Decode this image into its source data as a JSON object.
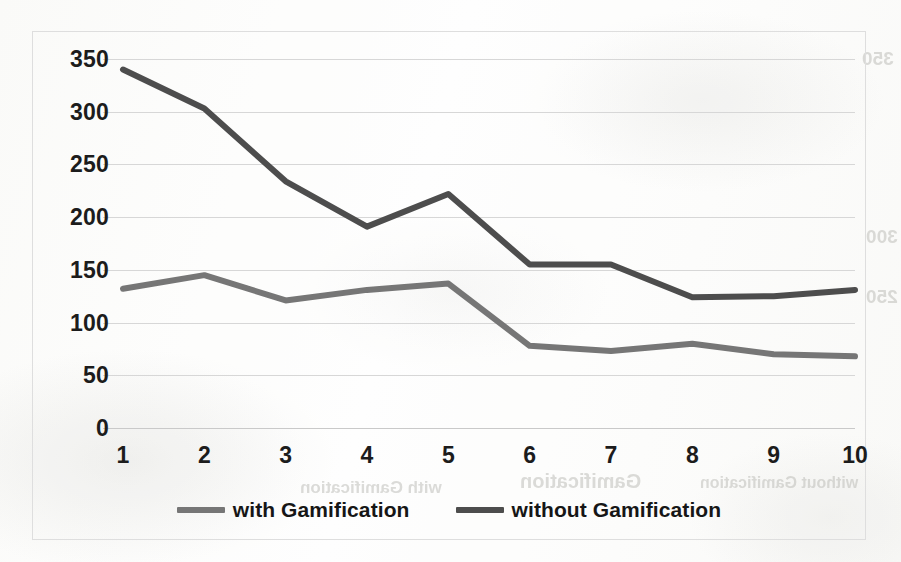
{
  "chart_data": {
    "type": "line",
    "title": "",
    "subtitle": "",
    "xlabel": "",
    "ylabel": "",
    "categories": [
      "1",
      "2",
      "3",
      "4",
      "5",
      "6",
      "7",
      "8",
      "9",
      "10"
    ],
    "x": [
      1,
      2,
      3,
      4,
      5,
      6,
      7,
      8,
      9,
      10
    ],
    "series": [
      {
        "name": "with Gamification",
        "color": "#767676",
        "values": [
          132,
          145,
          121,
          131,
          137,
          78,
          73,
          80,
          70,
          68
        ]
      },
      {
        "name": "without Gamification",
        "color": "#4d4d4d",
        "values": [
          340,
          303,
          234,
          191,
          222,
          155,
          155,
          124,
          125,
          131
        ]
      }
    ],
    "ylim": [
      0,
      350
    ],
    "xlim": [
      1,
      10
    ],
    "y_ticks": [
      0,
      50,
      100,
      150,
      200,
      250,
      300,
      350
    ],
    "y_tick_labels": [
      "0",
      "50",
      "100",
      "150",
      "200",
      "250",
      "300",
      "350"
    ],
    "x_tick_labels": [
      "1",
      "2",
      "3",
      "4",
      "5",
      "6",
      "7",
      "8",
      "9",
      "10"
    ],
    "grid": true,
    "grid_axis": "y",
    "legend_position": "bottom",
    "legend_entries": [
      "with Gamification",
      "without Gamification"
    ]
  },
  "chart": {
    "border_color": "#dedede",
    "gridline_color": "#d7d7d7",
    "background_color": "#fdfdfc",
    "tick_text_color": "#1c1c1c"
  },
  "legend": {
    "items": [
      {
        "label": "with Gamification",
        "color": "#767676"
      },
      {
        "label": "without Gamification",
        "color": "#4d4d4d"
      }
    ]
  },
  "scan_artifacts": {
    "bleed_text": [
      "with Gamification",
      "Gamification",
      "without Gamification",
      "350",
      "300",
      "250"
    ]
  }
}
